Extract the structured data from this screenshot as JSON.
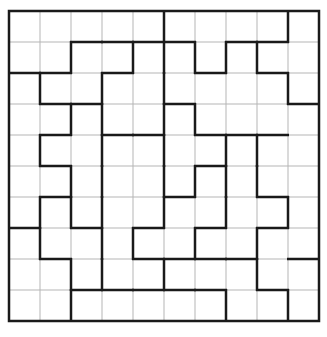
{
  "puzzle": {
    "rows": 10,
    "cols": 10,
    "origin": [
      9,
      11
    ],
    "cell": 31,
    "colors": {
      "thin": "#b5b5b5",
      "thick": "#1a1a1a",
      "background": "#ffffff"
    },
    "h_thick": {
      "1": [
        2,
        3,
        4,
        5,
        7,
        8
      ],
      "2": [
        0,
        1,
        3,
        6,
        8
      ],
      "3": [
        1,
        2,
        5,
        9
      ],
      "4": [
        1,
        3,
        4,
        6,
        7,
        8
      ],
      "5": [
        1,
        6
      ],
      "6": [
        1,
        5,
        8
      ],
      "7": [
        0,
        2,
        4,
        6,
        8
      ],
      "8": [
        1,
        4,
        5,
        6,
        7,
        9
      ],
      "9": [
        2,
        3,
        4,
        5,
        6,
        8
      ]
    },
    "v_thick": {
      "0": [
        5,
        9
      ],
      "1": [
        2,
        4,
        5,
        6,
        7,
        8
      ],
      "2": [
        1,
        3,
        5,
        9
      ],
      "3": [
        2,
        3,
        5,
        6
      ],
      "4": [
        1,
        3,
        5,
        7,
        8
      ],
      "5": [
        2,
        3,
        5,
        6,
        7,
        8
      ],
      "6": [
        1,
        2,
        3,
        5,
        7,
        9
      ],
      "7": [
        1,
        3,
        4,
        6,
        8
      ],
      "8": [
        2,
        3,
        5,
        8
      ],
      "9": [
        2,
        7,
        9
      ]
    }
  }
}
